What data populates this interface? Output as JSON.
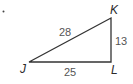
{
  "diagram": {
    "type": "right-triangle",
    "marker": ".",
    "vertices": [
      {
        "name": "J",
        "x": 29,
        "y": 62,
        "label_x": 20,
        "label_y": 73
      },
      {
        "name": "K",
        "x": 111,
        "y": 18,
        "label_x": 110,
        "label_y": 14
      },
      {
        "name": "L",
        "x": 111,
        "y": 62,
        "label_x": 111,
        "label_y": 74
      }
    ],
    "sides": [
      {
        "name": "JK",
        "length": "28",
        "label_x": 59,
        "label_y": 36
      },
      {
        "name": "KL",
        "length": "13",
        "label_x": 115,
        "label_y": 45
      },
      {
        "name": "JL",
        "length": "25",
        "label_x": 64,
        "label_y": 76
      }
    ],
    "colors": {
      "stroke": "#333333",
      "vertex_label": "#2b2b2b",
      "side_label": "#555555"
    }
  }
}
